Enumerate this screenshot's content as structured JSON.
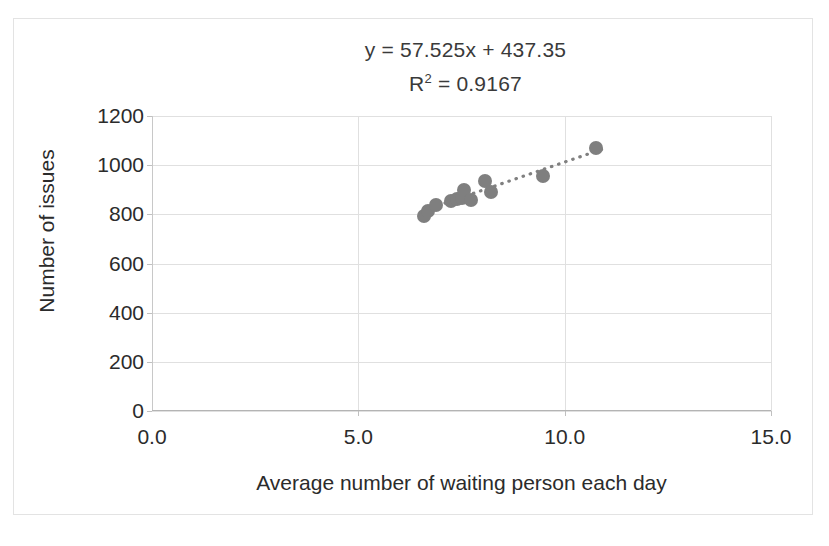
{
  "chart_data": {
    "type": "scatter",
    "title": "",
    "xlabel": "Average number of waiting person each day",
    "ylabel": "Number of issues",
    "xlim": [
      0,
      15
    ],
    "ylim": [
      0,
      1200
    ],
    "xticks": [
      "0.0",
      "5.0",
      "10.0",
      "15.0"
    ],
    "xtick_values": [
      0,
      5,
      10,
      15
    ],
    "yticks": [
      "0",
      "200",
      "400",
      "600",
      "800",
      "1000",
      "1200"
    ],
    "ytick_values": [
      0,
      200,
      400,
      600,
      800,
      1000,
      1200
    ],
    "grid": "horizontal-and-vertical",
    "legend": "none",
    "marker_color": "#7f7f7f",
    "trendline_color": "#808080",
    "trendline_style": "dotted",
    "annotations": {
      "equation": "y = 57.525x + 437.35",
      "r_squared_prefix": "R",
      "r_squared_sup": "2",
      "r_squared_value": " = 0.9167"
    },
    "series": [
      {
        "name": "Issues vs waiting persons",
        "points": [
          {
            "x": 6.6,
            "y": 795
          },
          {
            "x": 6.68,
            "y": 812
          },
          {
            "x": 6.88,
            "y": 836
          },
          {
            "x": 7.24,
            "y": 855
          },
          {
            "x": 7.4,
            "y": 861
          },
          {
            "x": 7.52,
            "y": 866
          },
          {
            "x": 7.56,
            "y": 900
          },
          {
            "x": 7.74,
            "y": 860
          },
          {
            "x": 8.06,
            "y": 936
          },
          {
            "x": 8.22,
            "y": 890
          },
          {
            "x": 9.48,
            "y": 956
          },
          {
            "x": 10.76,
            "y": 1070
          }
        ]
      }
    ],
    "trendline": {
      "slope": 57.525,
      "intercept": 437.35,
      "x_start": 7.1,
      "x_end": 11.0
    }
  }
}
